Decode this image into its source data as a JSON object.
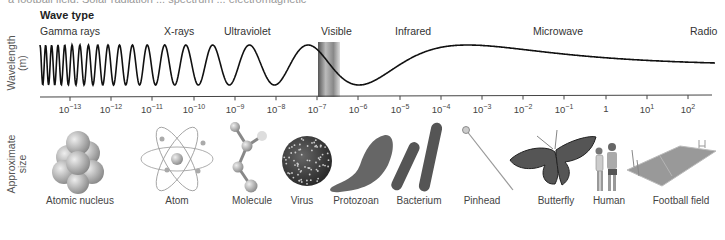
{
  "header": {
    "clipped_text": "a football field. Solar radiation ... spectrum ... electromagnetic",
    "title": "Wave type"
  },
  "wave_types": [
    {
      "label": "Gamma rays",
      "x": 40
    },
    {
      "label": "X-rays",
      "x": 164
    },
    {
      "label": "Ultraviolet",
      "x": 224
    },
    {
      "label": "Visible",
      "x": 321
    },
    {
      "label": "Infrared",
      "x": 395
    },
    {
      "label": "Microwave",
      "x": 533
    },
    {
      "label": "Radio",
      "x": 690
    }
  ],
  "axis": {
    "ylabel_line1": "Wavelength",
    "ylabel_line2": "(m)",
    "ticks": [
      {
        "base": "10",
        "exp": "−13",
        "x": 70
      },
      {
        "base": "10",
        "exp": "−12",
        "x": 111
      },
      {
        "base": "10",
        "exp": "−11",
        "x": 152
      },
      {
        "base": "10",
        "exp": "−10",
        "x": 194
      },
      {
        "base": "10",
        "exp": "−9",
        "x": 235
      },
      {
        "base": "10",
        "exp": "−8",
        "x": 276
      },
      {
        "base": "10",
        "exp": "−7",
        "x": 317
      },
      {
        "base": "10",
        "exp": "−6",
        "x": 358
      },
      {
        "base": "10",
        "exp": "−5",
        "x": 400
      },
      {
        "base": "10",
        "exp": "−4",
        "x": 441
      },
      {
        "base": "10",
        "exp": "−3",
        "x": 482
      },
      {
        "base": "10",
        "exp": "−2",
        "x": 523
      },
      {
        "base": "10",
        "exp": "−1",
        "x": 564
      },
      {
        "base": "1",
        "exp": "",
        "x": 606
      },
      {
        "base": "10",
        "exp": "1",
        "x": 647
      },
      {
        "base": "10",
        "exp": "2",
        "x": 688
      }
    ]
  },
  "size_section": {
    "label_line1": "Approximate",
    "label_line2": "size",
    "items": [
      {
        "label": "Atomic nucleus",
        "x": 80,
        "icon": "atomic-nucleus-icon"
      },
      {
        "label": "Atom",
        "x": 177,
        "icon": "atom-icon"
      },
      {
        "label": "Molecule",
        "x": 252,
        "icon": "molecule-icon"
      },
      {
        "label": "Virus",
        "x": 302,
        "icon": "virus-icon"
      },
      {
        "label": "Protozoan",
        "x": 356,
        "icon": "protozoan-icon"
      },
      {
        "label": "Bacterium",
        "x": 419,
        "icon": "bacterium-icon"
      },
      {
        "label": "Pinhead",
        "x": 482,
        "icon": "pinhead-icon"
      },
      {
        "label": "Butterfly",
        "x": 556,
        "icon": "butterfly-icon"
      },
      {
        "label": "Human",
        "x": 609,
        "icon": "human-icon"
      },
      {
        "label": "Football field",
        "x": 681,
        "icon": "football-field-icon"
      }
    ]
  },
  "chart_data": {
    "type": "diagram",
    "xlabel": "Wavelength (m)",
    "x_ticks": [
      "10^-13",
      "10^-12",
      "10^-11",
      "10^-10",
      "10^-9",
      "10^-8",
      "10^-7",
      "10^-6",
      "10^-5",
      "10^-4",
      "10^-3",
      "10^-2",
      "10^-1",
      "1",
      "10^1",
      "10^2"
    ],
    "regions": [
      "Gamma rays",
      "X-rays",
      "Ultraviolet",
      "Visible",
      "Infrared",
      "Microwave",
      "Radio"
    ],
    "size_examples": [
      "Atomic nucleus",
      "Atom",
      "Molecule",
      "Virus",
      "Protozoan",
      "Bacterium",
      "Pinhead",
      "Butterfly",
      "Human",
      "Football field"
    ]
  }
}
